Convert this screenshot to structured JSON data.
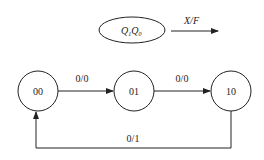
{
  "legend": {
    "state_label": "Q",
    "sub1": "1",
    "sub0": "0",
    "arrow_label": "X/F"
  },
  "states": [
    {
      "id": "s00",
      "label": "00"
    },
    {
      "id": "s01",
      "label": "01"
    },
    {
      "id": "s10",
      "label": "10"
    }
  ],
  "transitions": [
    {
      "from": "00",
      "to": "01",
      "label": "0/0"
    },
    {
      "from": "01",
      "to": "10",
      "label": "0/0"
    },
    {
      "from": "10",
      "to": "00",
      "label": "0/1"
    }
  ],
  "colors": {
    "stroke": "#222222",
    "background": "#ffffff"
  }
}
